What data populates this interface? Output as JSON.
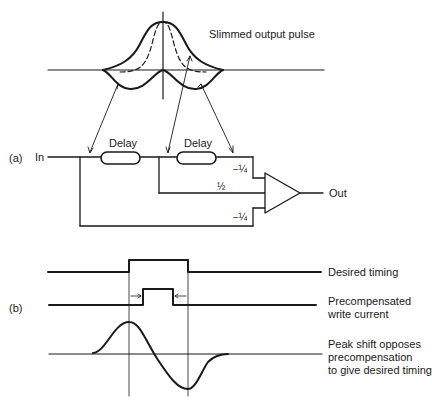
{
  "pulse": {
    "label": "Slimmed output pulse"
  },
  "circuit": {
    "panel_label": "(a)",
    "input_label": "In",
    "output_label": "Out",
    "delays": [
      {
        "label": "Delay"
      },
      {
        "label": "Delay"
      }
    ],
    "coefficients": {
      "top": "−¼",
      "middle": "½",
      "bottom": "−¼"
    }
  },
  "timing": {
    "panel_label": "(b)",
    "desired": "Desired timing",
    "precomp_line1": "Precompensated",
    "precomp_line2": "write current",
    "peak_line1": "Peak shift opposes",
    "peak_line2": "precompensation",
    "peak_line3": "to give desired timing"
  }
}
